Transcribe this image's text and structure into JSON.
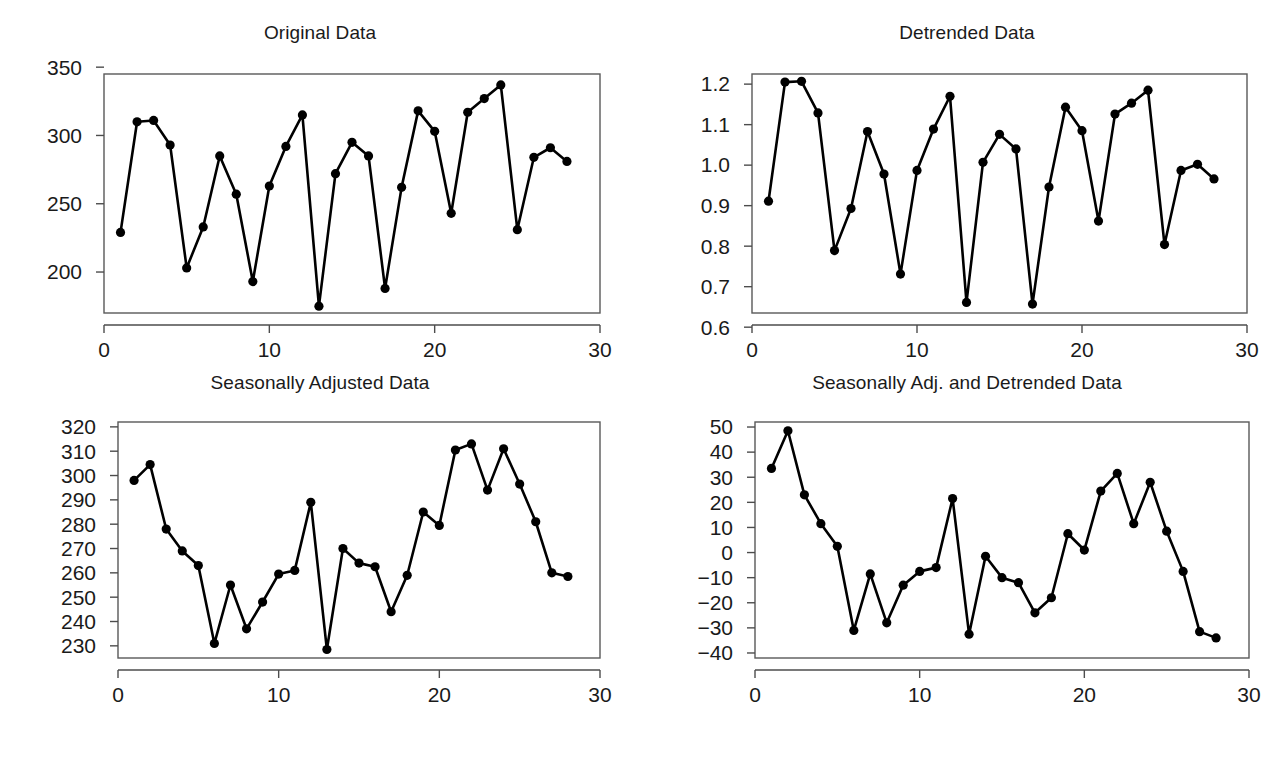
{
  "figure": {
    "background": "#ffffff",
    "line_color": "#000000",
    "axis_color": "#4d4d4d",
    "text_color": "#1a1a1a",
    "layout": "2x2 grid of time series line plots with filled circle markers"
  },
  "chart_data": [
    {
      "type": "line",
      "title": "Original Data",
      "xlabel": "",
      "ylabel": "",
      "xlim": [
        0,
        30
      ],
      "ylim": [
        170,
        345
      ],
      "xticks": [
        0,
        10,
        20,
        30
      ],
      "yticks": [
        200,
        250,
        300,
        350
      ],
      "xtick_labels": [
        "0",
        "10",
        "20",
        "30"
      ],
      "ytick_labels": [
        "200",
        "250",
        "300",
        "350"
      ],
      "grid": false,
      "legend": "none",
      "markers": "filled-circle",
      "x": [
        1,
        2,
        3,
        4,
        5,
        6,
        7,
        8,
        9,
        10,
        11,
        12,
        13,
        14,
        15,
        16,
        17,
        18,
        19,
        20,
        21,
        22,
        23,
        24,
        25,
        26,
        27,
        28
      ],
      "values": [
        229,
        310,
        311,
        293,
        203,
        233,
        285,
        257,
        193,
        263,
        292,
        315,
        175,
        272,
        295,
        285,
        188,
        262,
        318,
        303,
        243,
        317,
        327,
        337,
        231,
        284,
        291,
        281
      ]
    },
    {
      "type": "line",
      "title": "Detrended Data",
      "xlabel": "",
      "ylabel": "",
      "xlim": [
        0,
        30
      ],
      "ylim": [
        0.635,
        1.225
      ],
      "xticks": [
        0,
        10,
        20,
        30
      ],
      "yticks": [
        0.6,
        0.7,
        0.8,
        0.9,
        1.0,
        1.1,
        1.2
      ],
      "xtick_labels": [
        "0",
        "10",
        "20",
        "30"
      ],
      "ytick_labels": [
        "0.6",
        "0.7",
        "0.8",
        "0.9",
        "1.0",
        "1.1",
        "1.2"
      ],
      "grid": false,
      "legend": "none",
      "markers": "filled-circle",
      "x": [
        1,
        2,
        3,
        4,
        5,
        6,
        7,
        8,
        9,
        10,
        11,
        12,
        13,
        14,
        15,
        16,
        17,
        18,
        19,
        20,
        21,
        22,
        23,
        24,
        25,
        26,
        27,
        28
      ],
      "values": [
        0.911,
        1.205,
        1.207,
        1.129,
        0.789,
        0.893,
        1.083,
        0.978,
        0.731,
        0.987,
        1.089,
        1.17,
        0.661,
        1.007,
        1.076,
        1.04,
        0.657,
        0.946,
        1.143,
        1.085,
        0.862,
        1.126,
        1.153,
        1.185,
        0.804,
        0.987,
        1.002,
        0.966
      ]
    },
    {
      "type": "line",
      "title": "Seasonally Adjusted Data",
      "xlabel": "",
      "ylabel": "",
      "xlim": [
        0,
        30
      ],
      "ylim": [
        225,
        322
      ],
      "xticks": [
        0,
        10,
        20,
        30
      ],
      "yticks": [
        230,
        240,
        250,
        260,
        270,
        280,
        290,
        300,
        310,
        320
      ],
      "xtick_labels": [
        "0",
        "10",
        "20",
        "30"
      ],
      "ytick_labels": [
        "230",
        "240",
        "250",
        "260",
        "270",
        "280",
        "290",
        "300",
        "310",
        "320"
      ],
      "grid": false,
      "legend": "none",
      "markers": "filled-circle",
      "x": [
        1,
        2,
        3,
        4,
        5,
        6,
        7,
        8,
        9,
        10,
        11,
        12,
        13,
        14,
        15,
        16,
        17,
        18,
        19,
        20,
        21,
        22,
        23,
        24,
        25,
        26,
        27,
        28
      ],
      "values": [
        298,
        304.5,
        278,
        269,
        263,
        231,
        255,
        237,
        248,
        259.5,
        261,
        289,
        228.5,
        270,
        264,
        262.5,
        244,
        259,
        285,
        279.5,
        310.5,
        313,
        294,
        311,
        296.5,
        281,
        260,
        258.5
      ]
    },
    {
      "type": "line",
      "title": "Seasonally Adj. and Detrended Data",
      "xlabel": "",
      "ylabel": "",
      "xlim": [
        0,
        30
      ],
      "ylim": [
        -42,
        52
      ],
      "xticks": [
        0,
        10,
        20,
        30
      ],
      "yticks": [
        -40,
        -30,
        -20,
        -10,
        0,
        10,
        20,
        30,
        40,
        50
      ],
      "xtick_labels": [
        "0",
        "10",
        "20",
        "30"
      ],
      "ytick_labels": [
        "−40",
        "−30",
        "−20",
        "−10",
        "0",
        "10",
        "20",
        "30",
        "40",
        "50"
      ],
      "grid": false,
      "legend": "none",
      "markers": "filled-circle",
      "x": [
        1,
        2,
        3,
        4,
        5,
        6,
        7,
        8,
        9,
        10,
        11,
        12,
        13,
        14,
        15,
        16,
        17,
        18,
        19,
        20,
        21,
        22,
        23,
        24,
        25,
        26,
        27,
        28
      ],
      "values": [
        33.5,
        48.5,
        23,
        11.5,
        2.5,
        -31,
        -8.5,
        -28,
        -13,
        -7.5,
        -6,
        21.5,
        -32.5,
        -1.5,
        -10,
        -12,
        -24,
        -18,
        7.5,
        1,
        24.5,
        31.5,
        11.5,
        28,
        8.5,
        -7.5,
        -31.5,
        -34
      ]
    }
  ]
}
